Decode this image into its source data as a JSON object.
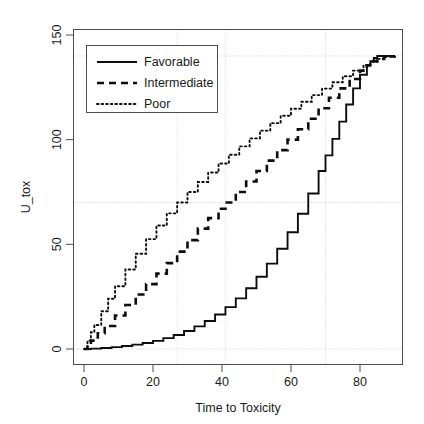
{
  "chart_data": {
    "type": "line",
    "title": "",
    "xlabel": "Time to Toxicity",
    "ylabel": "U_tox",
    "xlim": [
      -2,
      91
    ],
    "ylim": [
      -4,
      152
    ],
    "xticks": [
      0,
      20,
      40,
      60,
      80
    ],
    "yticks": [
      0,
      50,
      100,
      150
    ],
    "xtick_labels": [
      "0",
      "20",
      "40",
      "60",
      "80"
    ],
    "ytick_labels": [
      "0",
      "50",
      "100",
      "150"
    ],
    "grid": true,
    "gridlines": {
      "horizontal": [
        0,
        70,
        140
      ],
      "vertical": [
        27,
        41,
        70
      ]
    },
    "legend": {
      "position": "top-left",
      "entries": [
        {
          "label": "Favorable",
          "style": "solid"
        },
        {
          "label": "Intermediate",
          "style": "dashed"
        },
        {
          "label": "Poor",
          "style": "dotted"
        }
      ]
    },
    "series": [
      {
        "name": "Favorable",
        "style": "solid",
        "x": [
          0,
          2,
          5,
          8,
          11,
          14,
          17,
          20,
          23,
          26,
          29,
          32,
          35,
          38,
          41,
          44,
          47,
          50,
          53,
          56,
          59,
          62,
          65,
          68,
          70,
          72,
          74,
          76,
          78,
          80,
          82,
          83,
          84,
          85,
          86,
          88,
          90
        ],
        "y": [
          0,
          0.2,
          0.5,
          0.9,
          1.4,
          2.1,
          2.9,
          3.9,
          5.2,
          6.7,
          8.6,
          10.8,
          13.4,
          16.5,
          20.0,
          24.2,
          29.0,
          34.5,
          40.8,
          47.9,
          55.8,
          64.6,
          74.3,
          85.0,
          92.5,
          100.4,
          108.6,
          116.8,
          124.5,
          131.0,
          135.6,
          137.5,
          139.0,
          140.0,
          140.0,
          140.0,
          140.0
        ]
      },
      {
        "name": "Intermediate",
        "style": "dashed",
        "x": [
          0,
          1,
          2,
          4,
          6,
          9,
          12,
          15,
          18,
          21,
          24,
          27,
          30,
          33,
          36,
          39,
          41,
          44,
          47,
          50,
          53,
          56,
          59,
          62,
          65,
          68,
          71,
          74,
          77,
          80,
          82,
          84,
          85,
          87,
          90
        ],
        "y": [
          0,
          2.0,
          4.0,
          7.5,
          11.0,
          16.0,
          21.0,
          26.0,
          31.0,
          36.0,
          41.0,
          46.5,
          52.0,
          57.5,
          62.5,
          67.0,
          70.0,
          75.0,
          80.0,
          85.0,
          90.0,
          95.0,
          100.0,
          105.0,
          110.0,
          115.0,
          120.0,
          124.5,
          129.0,
          133.0,
          135.5,
          137.5,
          138.5,
          139.8,
          140.0
        ]
      },
      {
        "name": "Poor",
        "style": "dotted",
        "x": [
          0,
          1,
          2,
          3,
          5,
          7,
          9,
          12,
          15,
          18,
          21,
          24,
          27,
          30,
          33,
          36,
          39,
          42,
          45,
          48,
          51,
          54,
          57,
          60,
          63,
          66,
          69,
          72,
          75,
          78,
          81,
          83,
          85,
          87,
          90
        ],
        "y": [
          0,
          4.0,
          8.0,
          11.5,
          18.0,
          24.0,
          30.0,
          38.0,
          45.5,
          52.5,
          59.0,
          64.8,
          70.0,
          75.0,
          79.8,
          84.3,
          88.6,
          92.8,
          96.8,
          100.6,
          104.3,
          107.9,
          111.4,
          114.8,
          118.1,
          121.3,
          124.4,
          127.4,
          130.3,
          133.0,
          135.6,
          137.2,
          138.6,
          139.6,
          140.0
        ]
      }
    ]
  }
}
